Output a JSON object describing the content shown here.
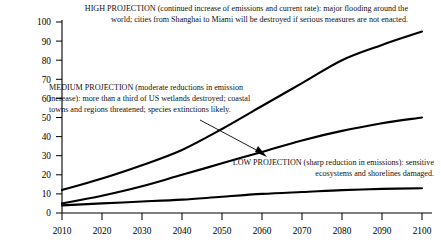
{
  "chart_data": {
    "type": "line",
    "title": "",
    "xlabel": "",
    "ylabel": "",
    "xlim": [
      2010,
      2100
    ],
    "ylim": [
      0,
      100
    ],
    "grid": false,
    "legend_position": "inline-annotations",
    "x": [
      2010,
      2020,
      2030,
      2040,
      2050,
      2060,
      2070,
      2080,
      2090,
      2100
    ],
    "xtick_labels": [
      "2010",
      "2020",
      "2030",
      "2040",
      "2050",
      "2060",
      "2070",
      "2080",
      "2090",
      "2100"
    ],
    "ytick_labels": [
      "0",
      "10",
      "20",
      "30",
      "40",
      "50",
      "60",
      "70",
      "80",
      "90",
      "100"
    ],
    "series": [
      {
        "name": "HIGH PROJECTION",
        "values": [
          12,
          18,
          25,
          33,
          44,
          56,
          68,
          80,
          88,
          95
        ]
      },
      {
        "name": "MEDIUM PROJECTION",
        "values": [
          5,
          9,
          14,
          20,
          26,
          32,
          38,
          43,
          47,
          50
        ]
      },
      {
        "name": "LOW PROJECTION",
        "values": [
          4,
          5,
          6,
          7,
          8.5,
          10,
          11,
          12,
          12.6,
          13
        ]
      }
    ],
    "annotations": [
      {
        "name": "high-projection-note",
        "text": "HIGH PROJECTION (continued increase of emissions and current rate): major flooding around the world; cities from Shanghai to Miami will be destroyed if serious measures are not enacted."
      },
      {
        "name": "medium-projection-note",
        "text": "MEDIUM PROJECTION (moderate reductions in emission increase): more than a third of US wetlands destroyed; coastal towns and regions threatened; species extinctions likely."
      },
      {
        "name": "low-projection-note",
        "text": "LOW PROJECTION (sharp reduction in emissions): sensitive ecosystems and shorelines damaged."
      }
    ],
    "arrow": {
      "name": "medium-projection-pointer",
      "from": [
        200,
        120
      ],
      "to": [
        267,
        157
      ]
    }
  },
  "annotations": {
    "high": "HIGH PROJECTION (continued increase of emissions and current rate): major flooding around the world; cities from Shanghai to Miami will be destroyed if serious measures are not enacted.",
    "medium": "MEDIUM PROJECTION (moderate reductions in emission increase): more than a third of US wetlands destroyed; coastal towns and regions threatened; species extinctions likely.",
    "low": "LOW PROJECTION (sharp reduction in emissions): sensitive ecosystems and shorelines damaged."
  },
  "axis": {
    "y": [
      "100",
      "90",
      "80",
      "70",
      "60",
      "50",
      "40",
      "30",
      "20",
      "10",
      "0"
    ],
    "x": [
      "2010",
      "2020",
      "2030",
      "2040",
      "2050",
      "2060",
      "2070",
      "2080",
      "2090",
      "2100"
    ]
  },
  "colors": {
    "line": "#000000",
    "axis": "#000000",
    "background": "#ffffff"
  }
}
